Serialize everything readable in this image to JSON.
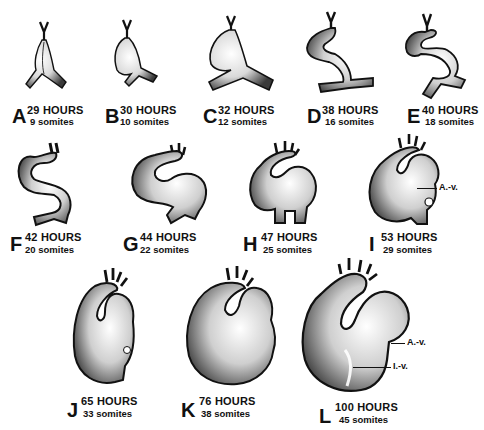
{
  "figure": {
    "stages": [
      {
        "letter": "A",
        "hours": "29 HOURS",
        "somites": "9 somites"
      },
      {
        "letter": "B",
        "hours": "30 HOURS",
        "somites": "10 somites"
      },
      {
        "letter": "C",
        "hours": "32 HOURS",
        "somites": "12 somites"
      },
      {
        "letter": "D",
        "hours": "38 HOURS",
        "somites": "16 somites"
      },
      {
        "letter": "E",
        "hours": "40 HOURS",
        "somites": "18 somites"
      },
      {
        "letter": "F",
        "hours": "42 HOURS",
        "somites": "20 somites"
      },
      {
        "letter": "G",
        "hours": "44 HOURS",
        "somites": "22 somites"
      },
      {
        "letter": "H",
        "hours": "47 HOURS",
        "somites": "25 somites"
      },
      {
        "letter": "I",
        "hours": "53 HOURS",
        "somites": "29 somites"
      },
      {
        "letter": "J",
        "hours": "65 HOURS",
        "somites": "33 somites"
      },
      {
        "letter": "K",
        "hours": "76 HOURS",
        "somites": "38 somites"
      },
      {
        "letter": "L",
        "hours": "100 HOURS",
        "somites": "45 somites"
      }
    ],
    "annotations": {
      "i_av": "A.-v.",
      "l_av": "A.-v.",
      "l_iv": "I.-v."
    },
    "colors": {
      "ink": "#111111",
      "shade": "#6b6b6b",
      "paper": "#ffffff"
    }
  }
}
